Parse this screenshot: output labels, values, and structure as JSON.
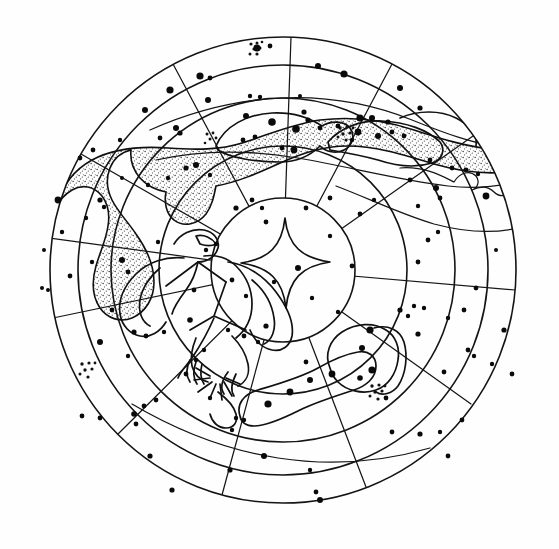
{
  "document": {
    "kind": "celestial-star-chart",
    "title": "Circular star chart (planisphere)",
    "background_color": "#fefefe",
    "ink_color": "#111111"
  },
  "chart_data": {
    "type": "scatter",
    "subtitle": "",
    "xlabel": "",
    "ylabel": "",
    "projection": "polar-azimuthal",
    "grid": true,
    "legend": "none",
    "center": {
      "x": 283,
      "y": 270
    },
    "rings": [
      {
        "name": "inner-circle",
        "radius": 72
      },
      {
        "name": "ring-1",
        "radius": 124
      },
      {
        "name": "ring-2",
        "radius": 172
      },
      {
        "name": "ring-3",
        "radius": 205
      },
      {
        "name": "outer-limb",
        "radius": 233
      }
    ],
    "radial_lines_count": 12,
    "radial_line_angles_deg": [
      5,
      35,
      62,
      90,
      118,
      150,
      182,
      212,
      240,
      268,
      300,
      332
    ],
    "milky_way_band": {
      "name": "milky-way",
      "fill": "stipple",
      "region": "upper-left through upper-center"
    },
    "constellation_figures": [
      {
        "name": "eagle-figure",
        "position": "left-of-center"
      },
      {
        "name": "elongated-constellation-upper",
        "position": "upper-center"
      },
      {
        "name": "elongated-constellation-upper-right",
        "position": "upper-right"
      },
      {
        "name": "serpentine-boundary-right",
        "position": "right"
      },
      {
        "name": "lower-constellation-pair",
        "position": "lower-right"
      }
    ],
    "open_clusters": [
      {
        "name": "cluster-top",
        "x": 257,
        "y": 50,
        "dots": 7
      },
      {
        "name": "cluster-upper-center",
        "x": 345,
        "y": 132,
        "dots": 7
      },
      {
        "name": "cluster-upper-right",
        "x": 345,
        "y": 134,
        "dots": 6
      },
      {
        "name": "cluster-lower-left",
        "x": 88,
        "y": 370,
        "dots": 7
      },
      {
        "name": "cluster-lower-right",
        "x": 378,
        "y": 392,
        "dots": 7
      }
    ],
    "stars": [
      {
        "x": 257,
        "y": 48,
        "mag": 3.6
      },
      {
        "x": 270,
        "y": 46,
        "mag": 2.4
      },
      {
        "x": 318,
        "y": 66,
        "mag": 3.0
      },
      {
        "x": 344,
        "y": 74,
        "mag": 3.6
      },
      {
        "x": 400,
        "y": 88,
        "mag": 3.0
      },
      {
        "x": 200,
        "y": 76,
        "mag": 3.6
      },
      {
        "x": 210,
        "y": 78,
        "mag": 2.4
      },
      {
        "x": 170,
        "y": 90,
        "mag": 3.6
      },
      {
        "x": 145,
        "y": 110,
        "mag": 3.0
      },
      {
        "x": 208,
        "y": 100,
        "mag": 3.0
      },
      {
        "x": 250,
        "y": 96,
        "mag": 2.2
      },
      {
        "x": 260,
        "y": 97,
        "mag": 2.2
      },
      {
        "x": 300,
        "y": 96,
        "mag": 2.0
      },
      {
        "x": 304,
        "y": 112,
        "mag": 2.6
      },
      {
        "x": 308,
        "y": 120,
        "mag": 2.6
      },
      {
        "x": 272,
        "y": 122,
        "mag": 3.8
      },
      {
        "x": 255,
        "y": 137,
        "mag": 2.4
      },
      {
        "x": 243,
        "y": 140,
        "mag": 2.4
      },
      {
        "x": 282,
        "y": 148,
        "mag": 2.4
      },
      {
        "x": 294,
        "y": 150,
        "mag": 3.4
      },
      {
        "x": 296,
        "y": 129,
        "mag": 3.8
      },
      {
        "x": 360,
        "y": 118,
        "mag": 3.6
      },
      {
        "x": 372,
        "y": 118,
        "mag": 3.0
      },
      {
        "x": 388,
        "y": 122,
        "mag": 2.6
      },
      {
        "x": 358,
        "y": 132,
        "mag": 3.4
      },
      {
        "x": 378,
        "y": 136,
        "mag": 3.0
      },
      {
        "x": 392,
        "y": 132,
        "mag": 2.4
      },
      {
        "x": 352,
        "y": 140,
        "mag": 2.2
      },
      {
        "x": 338,
        "y": 126,
        "mag": 2.4
      },
      {
        "x": 320,
        "y": 128,
        "mag": 2.4
      },
      {
        "x": 420,
        "y": 108,
        "mag": 2.6
      },
      {
        "x": 404,
        "y": 136,
        "mag": 2.4
      },
      {
        "x": 452,
        "y": 168,
        "mag": 2.4
      },
      {
        "x": 466,
        "y": 170,
        "mag": 2.4
      },
      {
        "x": 478,
        "y": 174,
        "mag": 2.2
      },
      {
        "x": 430,
        "y": 160,
        "mag": 2.4
      },
      {
        "x": 486,
        "y": 196,
        "mag": 3.4
      },
      {
        "x": 436,
        "y": 188,
        "mag": 3.0
      },
      {
        "x": 410,
        "y": 180,
        "mag": 2.4
      },
      {
        "x": 176,
        "y": 128,
        "mag": 3.0
      },
      {
        "x": 180,
        "y": 133,
        "mag": 2.6
      },
      {
        "x": 160,
        "y": 138,
        "mag": 2.4
      },
      {
        "x": 120,
        "y": 140,
        "mag": 2.2
      },
      {
        "x": 93,
        "y": 150,
        "mag": 2.4
      },
      {
        "x": 80,
        "y": 158,
        "mag": 2.4
      },
      {
        "x": 196,
        "y": 165,
        "mag": 3.0
      },
      {
        "x": 186,
        "y": 168,
        "mag": 2.6
      },
      {
        "x": 210,
        "y": 175,
        "mag": 2.2
      },
      {
        "x": 168,
        "y": 178,
        "mag": 2.2
      },
      {
        "x": 148,
        "y": 185,
        "mag": 2.2
      },
      {
        "x": 100,
        "y": 200,
        "mag": 2.6
      },
      {
        "x": 104,
        "y": 207,
        "mag": 2.2
      },
      {
        "x": 58,
        "y": 200,
        "mag": 3.4
      },
      {
        "x": 62,
        "y": 232,
        "mag": 2.2
      },
      {
        "x": 86,
        "y": 218,
        "mag": 2.2
      },
      {
        "x": 44,
        "y": 250,
        "mag": 2.0
      },
      {
        "x": 42,
        "y": 288,
        "mag": 2.0
      },
      {
        "x": 48,
        "y": 290,
        "mag": 2.0
      },
      {
        "x": 70,
        "y": 276,
        "mag": 2.4
      },
      {
        "x": 92,
        "y": 262,
        "mag": 2.2
      },
      {
        "x": 122,
        "y": 260,
        "mag": 3.0
      },
      {
        "x": 128,
        "y": 272,
        "mag": 2.4
      },
      {
        "x": 112,
        "y": 310,
        "mag": 2.4
      },
      {
        "x": 100,
        "y": 342,
        "mag": 3.0
      },
      {
        "x": 128,
        "y": 356,
        "mag": 2.2
      },
      {
        "x": 82,
        "y": 416,
        "mag": 2.4
      },
      {
        "x": 100,
        "y": 418,
        "mag": 2.4
      },
      {
        "x": 134,
        "y": 414,
        "mag": 2.8
      },
      {
        "x": 136,
        "y": 424,
        "mag": 2.4
      },
      {
        "x": 150,
        "y": 456,
        "mag": 2.6
      },
      {
        "x": 172,
        "y": 490,
        "mag": 2.6
      },
      {
        "x": 230,
        "y": 470,
        "mag": 2.6
      },
      {
        "x": 232,
        "y": 430,
        "mag": 2.2
      },
      {
        "x": 264,
        "y": 456,
        "mag": 3.0
      },
      {
        "x": 310,
        "y": 470,
        "mag": 2.2
      },
      {
        "x": 320,
        "y": 500,
        "mag": 3.0
      },
      {
        "x": 316,
        "y": 492,
        "mag": 2.4
      },
      {
        "x": 236,
        "y": 418,
        "mag": 2.2
      },
      {
        "x": 244,
        "y": 420,
        "mag": 2.2
      },
      {
        "x": 268,
        "y": 404,
        "mag": 3.6
      },
      {
        "x": 290,
        "y": 392,
        "mag": 3.4
      },
      {
        "x": 310,
        "y": 380,
        "mag": 3.0
      },
      {
        "x": 332,
        "y": 374,
        "mag": 3.4
      },
      {
        "x": 360,
        "y": 378,
        "mag": 2.8
      },
      {
        "x": 372,
        "y": 370,
        "mag": 3.6
      },
      {
        "x": 362,
        "y": 348,
        "mag": 3.0
      },
      {
        "x": 370,
        "y": 330,
        "mag": 3.6
      },
      {
        "x": 386,
        "y": 398,
        "mag": 2.4
      },
      {
        "x": 392,
        "y": 432,
        "mag": 2.4
      },
      {
        "x": 420,
        "y": 434,
        "mag": 2.6
      },
      {
        "x": 440,
        "y": 432,
        "mag": 2.2
      },
      {
        "x": 448,
        "y": 456,
        "mag": 2.4
      },
      {
        "x": 462,
        "y": 420,
        "mag": 2.4
      },
      {
        "x": 400,
        "y": 310,
        "mag": 2.6
      },
      {
        "x": 408,
        "y": 316,
        "mag": 2.2
      },
      {
        "x": 414,
        "y": 306,
        "mag": 2.2
      },
      {
        "x": 424,
        "y": 308,
        "mag": 2.2
      },
      {
        "x": 418,
        "y": 334,
        "mag": 2.6
      },
      {
        "x": 448,
        "y": 318,
        "mag": 2.2
      },
      {
        "x": 464,
        "y": 310,
        "mag": 2.4
      },
      {
        "x": 476,
        "y": 288,
        "mag": 2.4
      },
      {
        "x": 504,
        "y": 330,
        "mag": 2.6
      },
      {
        "x": 468,
        "y": 350,
        "mag": 2.4
      },
      {
        "x": 474,
        "y": 356,
        "mag": 2.2
      },
      {
        "x": 492,
        "y": 364,
        "mag": 2.2
      },
      {
        "x": 444,
        "y": 372,
        "mag": 2.4
      },
      {
        "x": 512,
        "y": 374,
        "mag": 2.4
      },
      {
        "x": 428,
        "y": 240,
        "mag": 2.4
      },
      {
        "x": 438,
        "y": 232,
        "mag": 2.2
      },
      {
        "x": 418,
        "y": 262,
        "mag": 2.4
      },
      {
        "x": 360,
        "y": 214,
        "mag": 2.4
      },
      {
        "x": 374,
        "y": 200,
        "mag": 2.2
      },
      {
        "x": 330,
        "y": 198,
        "mag": 2.4
      },
      {
        "x": 306,
        "y": 208,
        "mag": 2.4
      },
      {
        "x": 236,
        "y": 208,
        "mag": 2.6
      },
      {
        "x": 252,
        "y": 200,
        "mag": 2.4
      },
      {
        "x": 262,
        "y": 208,
        "mag": 2.2
      },
      {
        "x": 216,
        "y": 244,
        "mag": 2.2
      },
      {
        "x": 206,
        "y": 250,
        "mag": 2.2
      },
      {
        "x": 232,
        "y": 280,
        "mag": 2.4
      },
      {
        "x": 246,
        "y": 296,
        "mag": 2.2
      },
      {
        "x": 266,
        "y": 326,
        "mag": 2.6
      },
      {
        "x": 298,
        "y": 268,
        "mag": 3.0
      },
      {
        "x": 274,
        "y": 282,
        "mag": 2.2
      },
      {
        "x": 352,
        "y": 266,
        "mag": 2.4
      },
      {
        "x": 266,
        "y": 222,
        "mag": 2.4
      },
      {
        "x": 330,
        "y": 236,
        "mag": 2.2
      },
      {
        "x": 194,
        "y": 290,
        "mag": 2.4
      },
      {
        "x": 190,
        "y": 320,
        "mag": 2.8
      },
      {
        "x": 134,
        "y": 332,
        "mag": 2.6
      },
      {
        "x": 146,
        "y": 336,
        "mag": 2.4
      },
      {
        "x": 164,
        "y": 332,
        "mag": 2.2
      },
      {
        "x": 228,
        "y": 330,
        "mag": 2.2
      },
      {
        "x": 244,
        "y": 336,
        "mag": 2.4
      },
      {
        "x": 258,
        "y": 342,
        "mag": 2.2
      },
      {
        "x": 204,
        "y": 350,
        "mag": 2.2
      },
      {
        "x": 196,
        "y": 360,
        "mag": 2.2
      },
      {
        "x": 186,
        "y": 374,
        "mag": 2.4
      },
      {
        "x": 306,
        "y": 362,
        "mag": 2.4
      },
      {
        "x": 312,
        "y": 298,
        "mag": 2.2
      },
      {
        "x": 338,
        "y": 312,
        "mag": 2.2
      },
      {
        "x": 210,
        "y": 398,
        "mag": 2.2
      },
      {
        "x": 156,
        "y": 400,
        "mag": 2.4
      },
      {
        "x": 144,
        "y": 406,
        "mag": 2.4
      },
      {
        "x": 440,
        "y": 198,
        "mag": 2.4
      },
      {
        "x": 418,
        "y": 206,
        "mag": 2.2
      },
      {
        "x": 496,
        "y": 250,
        "mag": 2.0
      },
      {
        "x": 246,
        "y": 116,
        "mag": 3.0
      },
      {
        "x": 158,
        "y": 242,
        "mag": 2.2
      },
      {
        "x": 122,
        "y": 178,
        "mag": 2.0
      }
    ]
  },
  "elements": {
    "inner_star_glyph": "four-pointed-star",
    "figure_label": "eagle-constellation-outline",
    "milky_way_label": "milky-way-stippled-band"
  }
}
